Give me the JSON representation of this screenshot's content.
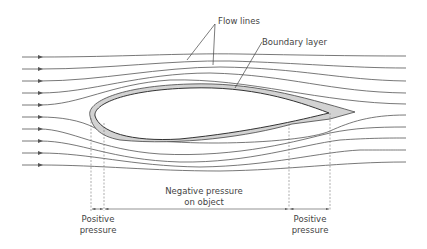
{
  "diagram": {
    "labels": {
      "flow_lines": "Flow lines",
      "boundary_layer": "Boundary layer",
      "negative_pressure_line1": "Negative pressure",
      "negative_pressure_line2": "on object",
      "positive_pressure_left_line1": "Positive",
      "positive_pressure_left_line2": "pressure",
      "positive_pressure_right_line1": "Positive",
      "positive_pressure_right_line2": "pressure"
    },
    "flow_line_count": 10,
    "colors": {
      "lines": "#555555",
      "boundary_layer_fill": "#cfcfcf",
      "text": "#444444"
    }
  }
}
